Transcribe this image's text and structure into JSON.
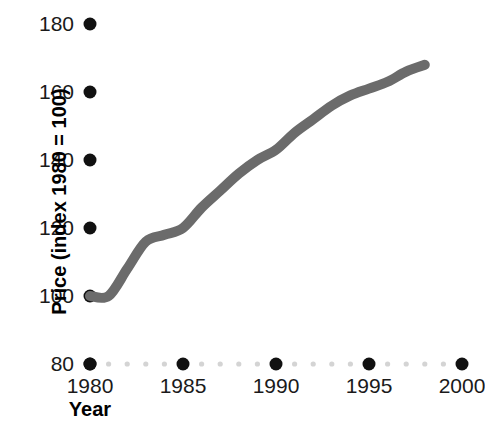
{
  "chart_data": {
    "type": "line",
    "title": "",
    "xlabel": "Year",
    "ylabel": "Price (index 1980 = 100)",
    "xlim": [
      1980,
      2000
    ],
    "ylim": [
      80,
      180
    ],
    "grid": false,
    "legend": false,
    "line_color": "#6b6b6b",
    "axis_dot_color": "#111111",
    "minor_dot_color": "#d4d4d4",
    "x_major_ticks": [
      1980,
      1985,
      1990,
      1995,
      2000
    ],
    "x_major_tick_labels": [
      "1980",
      "1985",
      "1990",
      "1995",
      "2000"
    ],
    "x_minor_ticks": [
      1981,
      1982,
      1983,
      1984,
      1986,
      1987,
      1988,
      1989,
      1991,
      1992,
      1993,
      1994,
      1996,
      1997,
      1998,
      1999
    ],
    "y_major_ticks": [
      80,
      100,
      120,
      140,
      160,
      180
    ],
    "y_major_tick_labels": [
      "80",
      "100",
      "120",
      "140",
      "160",
      "180"
    ],
    "x": [
      1980,
      1981,
      1982,
      1983,
      1984,
      1985,
      1986,
      1987,
      1988,
      1989,
      1990,
      1991,
      1992,
      1993,
      1994,
      1995,
      1996,
      1997,
      1998
    ],
    "values": [
      100,
      100,
      108,
      116,
      118,
      120,
      126,
      131,
      136,
      140,
      143,
      148,
      152,
      156,
      159,
      161,
      163,
      166,
      168
    ],
    "series": [
      {
        "name": "Price index",
        "values": [
          100,
          100,
          108,
          116,
          118,
          120,
          126,
          131,
          136,
          140,
          143,
          148,
          152,
          156,
          159,
          161,
          163,
          166,
          168
        ]
      }
    ]
  }
}
